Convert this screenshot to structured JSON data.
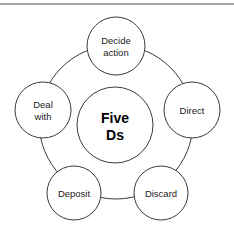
{
  "diagram": {
    "title": "Five Ds",
    "center": {
      "line1": "Five",
      "line2": "Ds",
      "cx": 115,
      "cy": 125,
      "r": 38
    },
    "ring": {
      "cx": 116,
      "cy": 122,
      "r": 77
    },
    "nodes": [
      {
        "id": "decide-action",
        "line1": "Decide",
        "line2": "action",
        "cx": 116,
        "cy": 46,
        "r": 29
      },
      {
        "id": "direct",
        "line1": "Direct",
        "line2": "",
        "cx": 192,
        "cy": 110,
        "r": 28
      },
      {
        "id": "discard",
        "line1": "Discard",
        "line2": "",
        "cx": 161,
        "cy": 193,
        "r": 27
      },
      {
        "id": "deposit",
        "line1": "Deposit",
        "line2": "",
        "cx": 74,
        "cy": 193,
        "r": 27
      },
      {
        "id": "deal-with",
        "line1": "Deal",
        "line2": "with",
        "cx": 43,
        "cy": 110,
        "r": 28
      }
    ],
    "colors": {
      "stroke": "#3a3a3a",
      "fill": "#ffffff",
      "rule": "#a8a8a8",
      "text": "#1a1a1a"
    }
  }
}
